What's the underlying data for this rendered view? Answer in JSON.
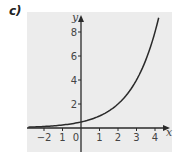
{
  "part_label": "c)",
  "colors": {
    "background": "#ffffff",
    "plot_background": "#ececec",
    "axis": "#2a2a2a",
    "curve": "#2a2a2a",
    "text": "#444444"
  },
  "chart_data": {
    "type": "line",
    "title": "",
    "xlabel": "x",
    "ylabel": "y",
    "xlim": [
      -2.9,
      4.6
    ],
    "ylim": [
      -2,
      9.5
    ],
    "x_ticks": [
      -2,
      -1,
      0,
      1,
      2,
      3,
      4
    ],
    "x_tick_labels": [
      "−2",
      "1",
      "0",
      "1",
      "2",
      "3",
      "4"
    ],
    "y_ticks": [
      2,
      4,
      6,
      8
    ],
    "y_tick_labels": [
      "2",
      "4",
      "6",
      "8"
    ],
    "grid": false,
    "legend": null,
    "series": [
      {
        "name": "y = 0.5·2^x",
        "x": [
          -2.85,
          -2,
          -1,
          0,
          1,
          2,
          3,
          3.5,
          4,
          4.2
        ],
        "y": [
          0.07,
          0.125,
          0.25,
          0.5,
          1,
          2,
          4,
          5.66,
          8,
          9.19
        ]
      }
    ]
  },
  "icons": {
    "x_axis_arrow": "arrow-right-icon",
    "y_axis_arrow": "arrow-up-icon"
  }
}
